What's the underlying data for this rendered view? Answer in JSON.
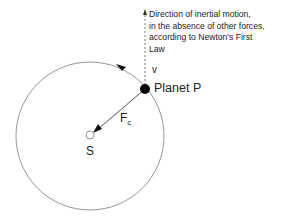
{
  "diagram": {
    "orbit": {
      "cx": 90,
      "cy": 136,
      "r": 74,
      "stroke": "#888888"
    },
    "sun": {
      "label": "S",
      "cx": 90,
      "cy": 135,
      "r": 4
    },
    "planet": {
      "label": "Planet P",
      "cx": 145,
      "cy": 89,
      "r": 5,
      "fill": "#000000"
    },
    "velocity": {
      "label": "v"
    },
    "centripetal_force": {
      "label": "F",
      "subscript": "c"
    },
    "inertial_direction_note": {
      "lines": [
        "Direction of inertial motion,",
        "in the absence of other forces,",
        "according to Newton's First",
        "Law"
      ]
    }
  }
}
